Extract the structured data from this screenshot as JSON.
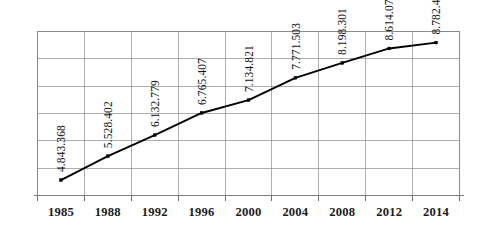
{
  "chart_data": {
    "type": "line",
    "title": "",
    "subtitle": "",
    "xlabel": "",
    "ylabel": "",
    "grid": true,
    "legend": "none",
    "categories": [
      "1985",
      "1988",
      "1992",
      "1996",
      "2000",
      "2004",
      "2008",
      "2012",
      "2014"
    ],
    "values": [
      4843368,
      5528402,
      6132779,
      6765407,
      7134821,
      7771503,
      8198301,
      8614071,
      8782406
    ],
    "point_labels": [
      "4.843.368",
      "5.528.402",
      "6.132.779",
      "6.765.407",
      "7.134.821",
      "7.771.503",
      "8.198.301",
      "8.614.071",
      "8.782.406"
    ],
    "series": [
      {
        "name": "series-1",
        "values": [
          4843368,
          5528402,
          6132779,
          6765407,
          7134821,
          7771503,
          8198301,
          8614071,
          8782406
        ],
        "color": "#000000",
        "marker": "square"
      }
    ],
    "ylim": [
      4400000,
      9100000
    ],
    "y_gridline_count": 6,
    "xlim_categories": 9,
    "colors": {
      "line": "#000000",
      "marker": "#000000",
      "grid": "#9a9a9a",
      "frame": "#8c8c8c",
      "axis": "#7d7d7d",
      "text": "#111111",
      "background": "#ffffff"
    }
  }
}
